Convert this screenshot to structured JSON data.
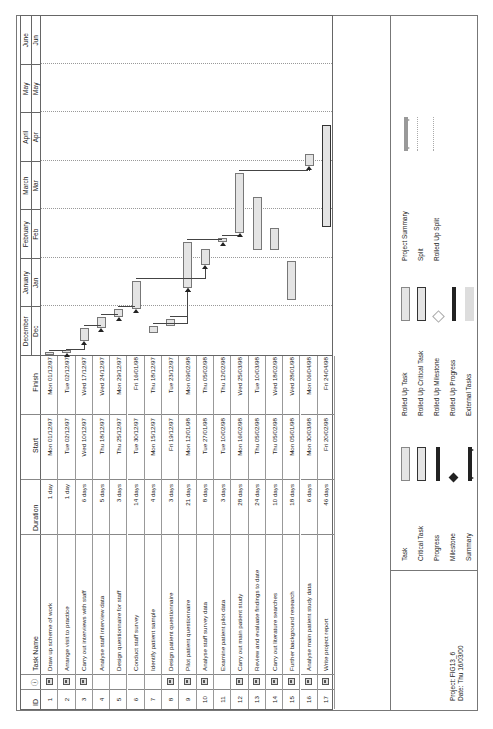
{
  "table": {
    "headers": {
      "id": "ID",
      "indicator": "ⓘ",
      "name": "Task Name",
      "duration": "Duration",
      "start": "Start",
      "finish": "Finish"
    },
    "rows": [
      {
        "id": "1",
        "note": true,
        "name": "Draw up scheme of work",
        "duration": "1 day",
        "start": "Mon 01/12/97",
        "finish": "Mon 01/12/97"
      },
      {
        "id": "2",
        "note": true,
        "name": "Arrange visit to practice",
        "duration": "1 day",
        "start": "Tue 02/12/97",
        "finish": "Tue 02/12/97"
      },
      {
        "id": "3",
        "note": true,
        "name": "Carry out interviews with staff",
        "duration": "6 days",
        "start": "Wed 10/12/97",
        "finish": "Wed 17/12/97"
      },
      {
        "id": "4",
        "note": false,
        "name": "Analyse staff interview data",
        "duration": "5 days",
        "start": "Thu 18/12/97",
        "finish": "Wed 24/12/97"
      },
      {
        "id": "5",
        "note": false,
        "name": "Design questionnaire for staff",
        "duration": "3 days",
        "start": "Thu 25/12/97",
        "finish": "Mon 29/12/97"
      },
      {
        "id": "6",
        "note": false,
        "name": "Conduct staff survey",
        "duration": "14 days",
        "start": "Tue 30/12/97",
        "finish": "Fri 16/01/98"
      },
      {
        "id": "7",
        "note": false,
        "name": "Identify patient sample",
        "duration": "4 days",
        "start": "Mon 15/12/97",
        "finish": "Thu 18/12/97"
      },
      {
        "id": "8",
        "note": true,
        "name": "Design patient questionnaire",
        "duration": "3 days",
        "start": "Fri 19/12/97",
        "finish": "Tue 23/12/97"
      },
      {
        "id": "9",
        "note": true,
        "name": "Pilot patient questionnaire",
        "duration": "21 days",
        "start": "Mon 12/01/98",
        "finish": "Mon 09/02/98"
      },
      {
        "id": "10",
        "note": true,
        "name": "Analyse staff survey data",
        "duration": "8 days",
        "start": "Tue 27/01/98",
        "finish": "Thu 05/02/98"
      },
      {
        "id": "11",
        "note": false,
        "name": "Examine patient pilot data",
        "duration": "3 days",
        "start": "Tue 10/02/98",
        "finish": "Thu 12/02/98"
      },
      {
        "id": "12",
        "note": true,
        "name": "Carry out main patient study",
        "duration": "28 days",
        "start": "Mon 16/02/98",
        "finish": "Wed 25/03/98"
      },
      {
        "id": "13",
        "note": true,
        "name": "Review and evaluate findings to date",
        "duration": "24 days",
        "start": "Thu 05/02/98",
        "finish": "Tue 10/03/98"
      },
      {
        "id": "14",
        "note": true,
        "name": "Carry out literature searches",
        "duration": "10 days",
        "start": "Thu 05/02/98",
        "finish": "Wed 18/02/98"
      },
      {
        "id": "15",
        "note": true,
        "name": "Further background research",
        "duration": "18 days",
        "start": "Mon 05/01/98",
        "finish": "Wed 28/01/98"
      },
      {
        "id": "16",
        "note": true,
        "name": "Analyse main patient study data",
        "duration": "6 days",
        "start": "Mon 30/03/98",
        "finish": "Mon 06/04/98"
      },
      {
        "id": "17",
        "note": true,
        "name": "Write project report",
        "duration": "46 days",
        "start": "Fri 20/02/98",
        "finish": "Fri 24/04/98"
      }
    ]
  },
  "timescale": {
    "months": [
      {
        "full": "December",
        "abbr": "Dec"
      },
      {
        "full": "January",
        "abbr": "Jan"
      },
      {
        "full": "February",
        "abbr": "Feb"
      },
      {
        "full": "March",
        "abbr": "Mar"
      },
      {
        "full": "April",
        "abbr": "Apr"
      },
      {
        "full": "May",
        "abbr": "May"
      },
      {
        "full": "June",
        "abbr": "Jun"
      }
    ]
  },
  "legend": {
    "project": "Project: FIG13_6",
    "date": "Date: Thu 16/03/00",
    "col1": [
      "Task",
      "Critical Task",
      "Progress",
      "Milestone",
      "Summary"
    ],
    "col2": [
      "Rolled Up Task",
      "Rolled Up Critical Task",
      "Rolled Up Milestone",
      "Rolled Up Progress",
      "External Tasks"
    ],
    "col3": [
      "Project Summary",
      "Split",
      "Rolled Up Split"
    ]
  }
}
